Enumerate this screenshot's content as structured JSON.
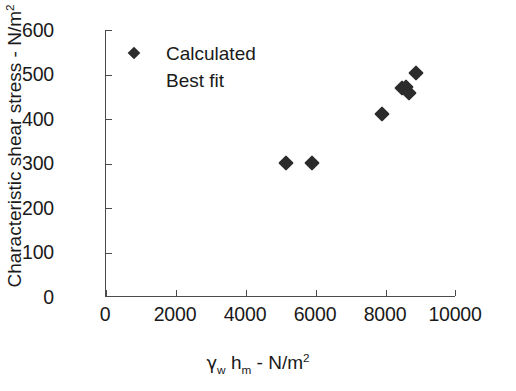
{
  "chart_data": {
    "type": "scatter",
    "title": "",
    "xlabel": "γw hm - N/m2",
    "xlabel_parts": {
      "gamma": "γ",
      "gamma_sub": "w",
      "h": "h",
      "h_sub": "m",
      "dash": "-",
      "unit": "N/m",
      "unit_sup": "2"
    },
    "ylabel": "Characteristic shear stress - N/m2",
    "ylabel_parts": {
      "text": "Characteristic shear stress - N/m",
      "sup": "2"
    },
    "xlim": [
      0,
      10000
    ],
    "ylim": [
      0,
      600
    ],
    "xticks": [
      0,
      2000,
      4000,
      6000,
      8000,
      10000
    ],
    "yticks": [
      0,
      100,
      200,
      300,
      400,
      500,
      600
    ],
    "xticklabels": [
      "0",
      "2000",
      "4000",
      "6000",
      "8000",
      "10000"
    ],
    "yticklabels": [
      "0",
      "100",
      "200",
      "300",
      "400",
      "500",
      "600"
    ],
    "grid": false,
    "legend_position": "upper-left-inside",
    "series": [
      {
        "name": "Calculated",
        "marker": "diamond",
        "color": "#2b2b2b",
        "points": [
          {
            "x": 5140,
            "y": 302
          },
          {
            "x": 5890,
            "y": 302
          },
          {
            "x": 7890,
            "y": 412
          },
          {
            "x": 8460,
            "y": 470
          },
          {
            "x": 8570,
            "y": 472
          },
          {
            "x": 8660,
            "y": 458
          },
          {
            "x": 8860,
            "y": 503
          }
        ]
      },
      {
        "name": "Best fit",
        "marker": "line",
        "color": "#2b2b2b",
        "points": []
      }
    ]
  },
  "legend": {
    "entries": [
      {
        "label": "Calculated",
        "has_marker": true
      },
      {
        "label": "Best fit",
        "has_marker": false
      }
    ]
  },
  "axes": {
    "y_title": "Characteristic shear stress - N/m",
    "y_title_sup": "2",
    "x_title_gamma": "γ",
    "x_title_gamma_sub": "w",
    "x_title_h": "h",
    "x_title_h_sub": "m",
    "x_title_sep": "-",
    "x_title_unit": "N/m",
    "x_title_unit_sup": "2"
  },
  "colors": {
    "marker": "#2b2b2b",
    "axis": "#4a4a4a",
    "background": "#ffffff",
    "text": "#1a1a1a"
  }
}
